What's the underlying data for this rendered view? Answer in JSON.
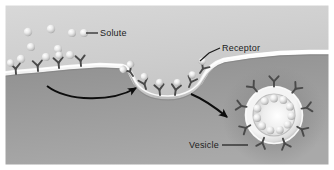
{
  "figure": {
    "border_color": "#ffffff",
    "cytoplasm_color": "#9a9a9a",
    "extracellular_color": "#c9c9c9",
    "membrane_color": "#f2f2f2",
    "receptor_color": "#4a4a4a",
    "solute_color": "#e8e8e8",
    "label_color": "#1c1c1c",
    "arrow_color": "#0d0d0d"
  },
  "labels": [
    {
      "id": "solute",
      "text": "Solute",
      "x": 100,
      "y": 29,
      "leader_from": [
        98,
        33
      ],
      "leader_to": [
        84,
        33
      ],
      "points_at": "free-solute-sphere"
    },
    {
      "id": "receptor",
      "text": "Receptor",
      "x": 222,
      "y": 44,
      "leader_from": [
        220,
        48
      ],
      "leader_to": [
        199,
        61
      ],
      "points_at": "membrane-receptor-at-pit-edge"
    },
    {
      "id": "vesicle",
      "text": "Vesicle",
      "x": 189,
      "y": 141,
      "leader_from": [
        221,
        145
      ],
      "leader_to": [
        250,
        145
      ],
      "points_at": "coated-vesicle"
    }
  ],
  "arrows": [
    {
      "id": "arrow-binding",
      "description": "curved arrow from free receptors to coated pit",
      "start": [
        47,
        86
      ],
      "end": [
        139,
        88
      ]
    },
    {
      "id": "arrow-budding",
      "description": "curved arrow from coated pit to vesicle",
      "start": [
        191,
        94
      ],
      "end": [
        230,
        119
      ]
    }
  ],
  "structures": {
    "free_solutes": [
      {
        "cx": 28,
        "cy": 32,
        "r": 4.2
      },
      {
        "cx": 51,
        "cy": 29,
        "r": 4.2
      },
      {
        "cx": 72,
        "cy": 33,
        "r": 4.0
      },
      {
        "cx": 84,
        "cy": 33,
        "r": 4.0
      },
      {
        "cx": 31,
        "cy": 47,
        "r": 4.0
      },
      {
        "cx": 58,
        "cy": 49,
        "r": 4.0
      },
      {
        "cx": 21,
        "cy": 59,
        "r": 4.2
      },
      {
        "cx": 46,
        "cy": 57,
        "r": 4.0
      },
      {
        "cx": 70,
        "cy": 55,
        "r": 4.0
      }
    ],
    "membrane_receptors_free": [
      {
        "x": 16,
        "y": 70
      },
      {
        "x": 37,
        "y": 68
      },
      {
        "x": 57,
        "y": 66
      },
      {
        "x": 78,
        "y": 64
      }
    ],
    "coated_pit": {
      "left_x": 131,
      "right_x": 205,
      "depth_y": 86,
      "receptor_count": 6,
      "bound_solute_count": 6
    },
    "vesicle": {
      "cx": 274,
      "cy": 115,
      "outer_r": 33,
      "shell_r": 27,
      "lumen_r": 20,
      "receptor_count": 9,
      "internal_solute_count": 11
    }
  }
}
